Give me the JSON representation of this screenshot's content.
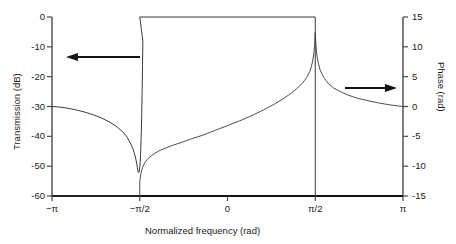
{
  "chart_data": {
    "type": "line",
    "title": "",
    "xlabel": "Normalized frequency (rad)",
    "ylabel": "Transmission (dB)",
    "y2label": "Phase (rad)",
    "grid": false,
    "legend": "none",
    "annotations": [
      {
        "name": "left-arrow",
        "points_to": "left-axis",
        "meaning": "Transmission curve uses left axis"
      },
      {
        "name": "right-arrow",
        "points_to": "right-axis",
        "meaning": "Phase curve uses right axis"
      }
    ],
    "x": {
      "label": "Normalized frequency (rad)",
      "ticks": [
        -3.14159,
        -1.5708,
        0,
        1.5708,
        3.14159
      ],
      "ticklabels": [
        "−π",
        "−π/2",
        "0",
        "π/2",
        "π"
      ],
      "lim": [
        -3.14159,
        3.14159
      ]
    },
    "y_left": {
      "label": "Transmission (dB)",
      "ticks": [
        0,
        -10,
        -20,
        -30,
        -40,
        -50,
        -60
      ],
      "ticklabels": [
        "0",
        "-10",
        "-20",
        "-30",
        "-40",
        "-50",
        "-60"
      ],
      "lim": [
        -60,
        0
      ]
    },
    "y_right": {
      "label": "Phase (rad)",
      "ticks": [
        15,
        10,
        5,
        0,
        -5,
        -10,
        -15
      ],
      "ticklabels": [
        "15",
        "10",
        "5",
        "0",
        "-5",
        "-10",
        "-15"
      ],
      "lim": [
        -15,
        15
      ]
    },
    "series": [
      {
        "name": "Transmission",
        "axis": "left",
        "unit": "dB",
        "description": "Bandpass response: 0 dB flat passband between -pi/2 and pi/2, deep notch to about -52 dB at -pi/2, -30 dB at -pi, slow roll toward -infinity near pi/2 edge",
        "points": [
          [
            -3.14159,
            -30.0
          ],
          [
            -3.0,
            -30.2
          ],
          [
            -2.85,
            -30.6
          ],
          [
            -2.7,
            -31.2
          ],
          [
            -2.55,
            -31.9
          ],
          [
            -2.4,
            -32.8
          ],
          [
            -2.25,
            -33.9
          ],
          [
            -2.1,
            -35.3
          ],
          [
            -1.98,
            -36.8
          ],
          [
            -1.88,
            -38.4
          ],
          [
            -1.8,
            -40.2
          ],
          [
            -1.74,
            -42.2
          ],
          [
            -1.69,
            -44.3
          ],
          [
            -1.655,
            -46.5
          ],
          [
            -1.63,
            -48.6
          ],
          [
            -1.612,
            -50.6
          ],
          [
            -1.6,
            -52.0
          ],
          [
            -1.5825,
            -52.0
          ],
          [
            -1.568,
            -50.0
          ],
          [
            -1.556,
            -46.0
          ],
          [
            -1.545,
            -40.0
          ],
          [
            -1.536,
            -33.0
          ],
          [
            -1.528,
            -25.0
          ],
          [
            -1.521,
            -16.0
          ],
          [
            -1.515,
            -8.0
          ],
          [
            -1.5708,
            0.0
          ],
          [
            -1.4,
            0.0
          ],
          [
            -1.0,
            0.0
          ],
          [
            -0.5,
            0.0
          ],
          [
            0.0,
            0.0
          ],
          [
            0.5,
            0.0
          ],
          [
            1.0,
            0.0
          ],
          [
            1.4,
            0.0
          ],
          [
            1.5708,
            0.0
          ],
          [
            1.5708,
            -60.0
          ]
        ]
      },
      {
        "name": "Phase",
        "axis": "right",
        "unit": "rad",
        "description": "Phase flat at -15 rad from -pi to -pi/2, steps up at -pi/2, rises monotonically through 0 near mid-band, sharp cusp peak near +12 rad at pi/2, then decays to 0 rad at pi",
        "points": [
          [
            -3.14159,
            -15.0
          ],
          [
            -2.0,
            -15.0
          ],
          [
            -1.6,
            -15.0
          ],
          [
            -1.5708,
            -15.0
          ],
          [
            -1.5708,
            -12.6
          ],
          [
            -1.55,
            -11.2
          ],
          [
            -1.52,
            -10.2
          ],
          [
            -1.48,
            -9.4
          ],
          [
            -1.42,
            -8.7
          ],
          [
            -1.34,
            -8.1
          ],
          [
            -1.24,
            -7.5
          ],
          [
            -1.12,
            -7.0
          ],
          [
            -0.98,
            -6.5
          ],
          [
            -0.82,
            -6.0
          ],
          [
            -0.64,
            -5.4
          ],
          [
            -0.44,
            -4.8
          ],
          [
            -0.22,
            -4.0
          ],
          [
            0.0,
            -3.2
          ],
          [
            0.22,
            -2.4
          ],
          [
            0.44,
            -1.5
          ],
          [
            0.64,
            -0.6
          ],
          [
            0.82,
            0.3
          ],
          [
            0.98,
            1.2
          ],
          [
            1.12,
            2.1
          ],
          [
            1.24,
            3.0
          ],
          [
            1.34,
            3.9
          ],
          [
            1.42,
            4.9
          ],
          [
            1.48,
            6.0
          ],
          [
            1.52,
            7.4
          ],
          [
            1.545,
            8.8
          ],
          [
            1.558,
            10.2
          ],
          [
            1.566,
            11.4
          ],
          [
            1.5708,
            12.4
          ],
          [
            1.5756,
            11.4
          ],
          [
            1.584,
            10.2
          ],
          [
            1.597,
            8.8
          ],
          [
            1.622,
            7.4
          ],
          [
            1.662,
            6.0
          ],
          [
            1.72,
            4.9
          ],
          [
            1.8,
            3.9
          ],
          [
            1.9,
            3.1
          ],
          [
            2.02,
            2.5
          ],
          [
            2.16,
            1.9
          ],
          [
            2.32,
            1.4
          ],
          [
            2.5,
            1.0
          ],
          [
            2.7,
            0.6
          ],
          [
            2.92,
            0.25
          ],
          [
            3.14159,
            0.0
          ]
        ]
      }
    ],
    "colors": {
      "curve": "#3a3a3a",
      "axis": "#4a4a4a",
      "baseline": "#111111",
      "text": "#1a1a1a",
      "background": "#ffffff"
    }
  },
  "axes": {
    "xlabel": "Normalized frequency (rad)",
    "ylabel_left": "Transmission (dB)",
    "ylabel_right": "Phase (rad)",
    "xticks": [
      "−π",
      "−π/2",
      "0",
      "π/2",
      "π"
    ],
    "yticks_left": [
      "0",
      "-10",
      "-20",
      "-30",
      "-40",
      "-50",
      "-60"
    ],
    "yticks_right": [
      "15",
      "10",
      "5",
      "0",
      "-5",
      "-10",
      "-15"
    ]
  }
}
